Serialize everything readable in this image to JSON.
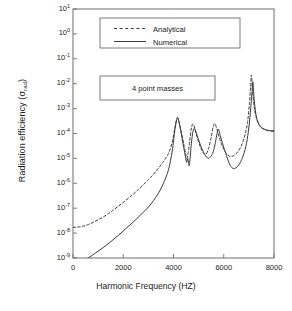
{
  "chart_data": {
    "type": "line",
    "title": "",
    "xlabel": "Harmonic Frequency (HZ)",
    "ylabel": "Radiation efficiency (σ",
    "ylabel_sub": "rad",
    "ylabel_close": ")",
    "xlim": [
      0,
      8000
    ],
    "ylim": [
      1e-09,
      10
    ],
    "yscale": "log",
    "xscale": "linear",
    "grid": false,
    "xticks": [
      0,
      2000,
      4000,
      6000,
      8000
    ],
    "xticklabels": [
      "0",
      "2000",
      "4000",
      "6000",
      "8000"
    ],
    "yticks": [
      10,
      1,
      0.1,
      0.01,
      0.001,
      0.0001,
      1e-05,
      1e-06,
      1e-07,
      1e-08,
      1e-09
    ],
    "yticklabels": [
      "10",
      "10",
      "10",
      "10",
      "10",
      "10",
      "10",
      "10",
      "10",
      "10",
      "10"
    ],
    "yticksuperscripts": [
      "1",
      "0",
      "-1",
      "-2",
      "-3",
      "-4",
      "-5",
      "-6",
      "-7",
      "-8",
      "-9"
    ],
    "legend": {
      "position": "upper-left-inset",
      "entries": [
        {
          "name": "Analytical",
          "style": "dashed",
          "color": "#3a3a3a"
        },
        {
          "name": "Numerical",
          "style": "solid",
          "color": "#3a3a3a"
        }
      ]
    },
    "annotations": [
      {
        "text": "4 point masses",
        "box": true
      }
    ],
    "series": [
      {
        "name": "Analytical",
        "style": "dashed",
        "color": "#3a3a3a",
        "points": [
          [
            0,
            1.7e-08
          ],
          [
            200,
            1.75e-08
          ],
          [
            400,
            1.9e-08
          ],
          [
            600,
            2.2e-08
          ],
          [
            800,
            2.7e-08
          ],
          [
            1000,
            3.4e-08
          ],
          [
            1200,
            4.4e-08
          ],
          [
            1400,
            6e-08
          ],
          [
            1600,
            8.3e-08
          ],
          [
            1800,
            1.2e-07
          ],
          [
            2000,
            1.7e-07
          ],
          [
            2200,
            2.5e-07
          ],
          [
            2400,
            3.7e-07
          ],
          [
            2600,
            5.6e-07
          ],
          [
            2800,
            8.7e-07
          ],
          [
            3000,
            1.4e-06
          ],
          [
            3200,
            2.3e-06
          ],
          [
            3400,
            4e-06
          ],
          [
            3600,
            7.5e-06
          ],
          [
            3800,
            1.6e-05
          ],
          [
            3950,
            4.5e-05
          ],
          [
            4050,
            0.00016
          ],
          [
            4120,
            0.00036
          ],
          [
            4170,
            0.0004
          ],
          [
            4250,
            0.00022
          ],
          [
            4350,
            8e-05
          ],
          [
            4420,
            3.2e-05
          ],
          [
            4480,
            1.6e-05
          ],
          [
            4530,
            1e-05
          ],
          [
            4580,
            1.6e-05
          ],
          [
            4640,
            4.5e-05
          ],
          [
            4700,
            0.00014
          ],
          [
            4760,
            0.00024
          ],
          [
            4820,
            0.0002
          ],
          [
            4900,
            0.0001
          ],
          [
            5000,
            4.5e-05
          ],
          [
            5100,
            2.4e-05
          ],
          [
            5200,
            1.6e-05
          ],
          [
            5300,
            1.5e-05
          ],
          [
            5400,
            2.6e-05
          ],
          [
            5500,
            7e-05
          ],
          [
            5580,
            0.00019
          ],
          [
            5640,
            0.00025
          ],
          [
            5720,
            0.00016
          ],
          [
            5820,
            7e-05
          ],
          [
            5950,
            3e-05
          ],
          [
            6100,
            1.6e-05
          ],
          [
            6250,
            1.2e-05
          ],
          [
            6400,
            1.3e-05
          ],
          [
            6550,
            1.8e-05
          ],
          [
            6700,
            3.2e-05
          ],
          [
            6850,
            9e-05
          ],
          [
            6950,
            0.0003
          ],
          [
            7020,
            0.0016
          ],
          [
            7070,
            0.008
          ],
          [
            7100,
            0.022
          ],
          [
            7140,
            0.0065
          ],
          [
            7200,
            0.0014
          ],
          [
            7280,
            0.0005
          ],
          [
            7400,
            0.00024
          ],
          [
            7550,
            0.00016
          ],
          [
            7700,
            0.000135
          ],
          [
            7850,
            0.000125
          ],
          [
            8000,
            0.00012
          ]
        ]
      },
      {
        "name": "Numerical",
        "style": "solid",
        "color": "#3a3a3a",
        "points": [
          [
            0,
            6e-10
          ],
          [
            300,
            7.5e-10
          ],
          [
            600,
            1e-09
          ],
          [
            900,
            1.6e-09
          ],
          [
            1200,
            2.6e-09
          ],
          [
            1500,
            4.5e-09
          ],
          [
            1800,
            8e-09
          ],
          [
            2100,
            1.5e-08
          ],
          [
            2400,
            2.8e-08
          ],
          [
            2700,
            5.5e-08
          ],
          [
            3000,
            1.1e-07
          ],
          [
            3200,
            2e-07
          ],
          [
            3400,
            4e-07
          ],
          [
            3600,
            1e-06
          ],
          [
            3800,
            3.5e-06
          ],
          [
            3950,
            2e-05
          ],
          [
            4050,
            0.00013
          ],
          [
            4130,
            0.00036
          ],
          [
            4180,
            0.00042
          ],
          [
            4260,
            0.00018
          ],
          [
            4360,
            5e-05
          ],
          [
            4450,
            1.6e-05
          ],
          [
            4520,
            7e-06
          ],
          [
            4570,
            1e-05
          ],
          [
            4620,
            5e-06
          ],
          [
            4660,
            1e-05
          ],
          [
            4700,
            3e-05
          ],
          [
            4760,
            0.0001
          ],
          [
            4820,
            0.00016
          ],
          [
            4900,
            0.00011
          ],
          [
            5000,
            5.5e-05
          ],
          [
            5120,
            2.6e-05
          ],
          [
            5250,
            1.4e-05
          ],
          [
            5380,
            1e-05
          ],
          [
            5450,
            1.1e-05
          ],
          [
            5560,
            1.6e-05
          ],
          [
            5650,
            3.5e-05
          ],
          [
            5720,
            8.5e-05
          ],
          [
            5780,
            0.00015
          ],
          [
            5840,
            0.0001
          ],
          [
            5950,
            4e-05
          ],
          [
            6080,
            1.6e-05
          ],
          [
            6200,
            7e-06
          ],
          [
            6330,
            4.2e-06
          ],
          [
            6450,
            4e-06
          ],
          [
            6600,
            5.5e-06
          ],
          [
            6750,
            1.1e-05
          ],
          [
            6880,
            3e-05
          ],
          [
            6980,
            0.00012
          ],
          [
            7060,
            0.0007
          ],
          [
            7120,
            0.004
          ],
          [
            7160,
            0.012
          ],
          [
            7200,
            0.0032
          ],
          [
            7260,
            0.0008
          ],
          [
            7340,
            0.00032
          ],
          [
            7450,
            0.00019
          ],
          [
            7600,
            0.00015
          ],
          [
            7750,
            0.000135
          ],
          [
            7900,
            0.00013
          ],
          [
            8000,
            0.00013
          ]
        ]
      }
    ]
  },
  "annotation_box": {
    "label": "4 point masses"
  },
  "caption": {
    "text": ""
  }
}
